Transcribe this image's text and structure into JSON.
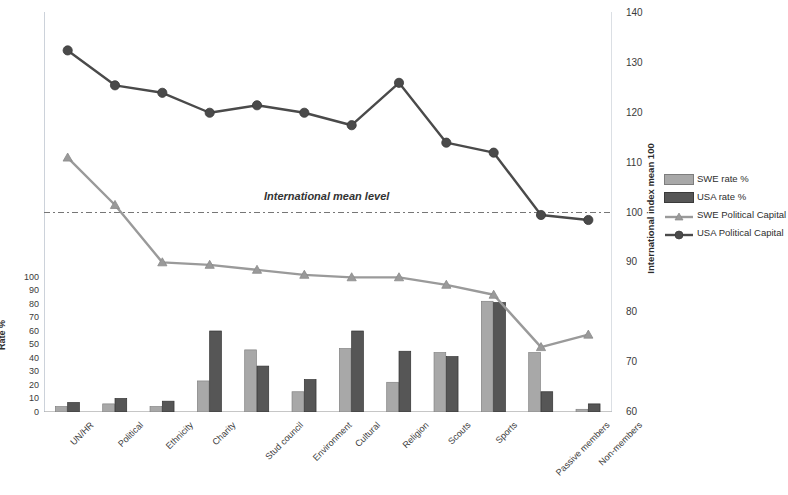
{
  "chart_data": {
    "type": "bar",
    "title": "",
    "subtitle": "",
    "categories": [
      "UN/HR",
      "Political",
      "Ethnicity",
      "Charity",
      "Stud council",
      "Environment",
      "Cultural",
      "Religion",
      "Scouts",
      "Sports",
      "Passive members",
      "Non-members"
    ],
    "series": [
      {
        "name": "SWE rate %",
        "type": "bar",
        "axis": "left",
        "color": "#a8a8a8",
        "values": [
          4,
          6,
          4,
          23,
          46,
          15,
          47,
          22,
          44,
          82,
          44,
          2
        ]
      },
      {
        "name": "USA rate %",
        "type": "bar",
        "axis": "left",
        "color": "#565656",
        "values": [
          7,
          10,
          8,
          60,
          34,
          24,
          60,
          45,
          41,
          81,
          15,
          6
        ]
      },
      {
        "name": "SWE Political Capital",
        "type": "line",
        "axis": "right",
        "color": "#9a9a9a",
        "marker": "triangle",
        "values": [
          111,
          101.5,
          90,
          89.5,
          88.5,
          87.5,
          87,
          87,
          85.5,
          83.5,
          73,
          75.5
        ]
      },
      {
        "name": "USA Political Capital",
        "type": "line",
        "axis": "right",
        "color": "#4a4a4a",
        "marker": "circle",
        "values": [
          132.5,
          125.5,
          124,
          120,
          121.5,
          120,
          117.5,
          126,
          114,
          112,
          99.5,
          98.5
        ]
      }
    ],
    "left_axis": {
      "label": "Rate %",
      "ticks": [
        0,
        10,
        20,
        30,
        40,
        50,
        60,
        70,
        80,
        90,
        100
      ],
      "min": 0,
      "max": 100
    },
    "right_axis": {
      "label": "International index mean 100",
      "ticks": [
        60,
        70,
        80,
        90,
        100,
        110,
        120,
        130,
        140
      ],
      "min": 60,
      "max": 140
    },
    "annotations": [
      {
        "name": "international-mean-level",
        "text": "International mean level",
        "value": 100,
        "axis": "right",
        "style": "dashed"
      }
    ],
    "legend": {
      "position": "right",
      "entries": [
        {
          "label": "SWE rate %",
          "marker": "swatch-light"
        },
        {
          "label": "USA rate %",
          "marker": "swatch-dark"
        },
        {
          "label": "SWE Political Capital",
          "marker": "line-triangle-light"
        },
        {
          "label": "USA Political Capital",
          "marker": "line-circle-dark"
        }
      ]
    },
    "grid": false,
    "xlabel": "",
    "ylabel": "Rate %"
  }
}
